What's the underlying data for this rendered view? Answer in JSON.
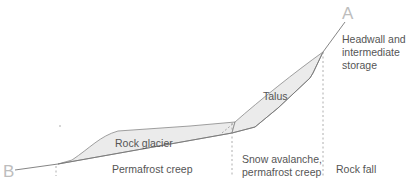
{
  "diagram": {
    "type": "cross-section profile",
    "endpoints": {
      "A": "A",
      "B": "B"
    },
    "deposits": {
      "rock_glacier": "Rock glacier",
      "talus": "Talus"
    },
    "zones": [
      {
        "id": "permafrost",
        "label": "Permafrost creep"
      },
      {
        "id": "snow",
        "label_line1": "Snow avalanche,",
        "label_line2": "permafrost creep"
      },
      {
        "id": "rockfall",
        "label": "Rock fall"
      }
    ],
    "headwall": {
      "line1": "Headwall and",
      "line2": "intermediate",
      "line3": "storage"
    },
    "colors": {
      "line": "#777777",
      "fill": "#ebebeb",
      "label_text": "#555555",
      "endpoint_text": "#bdbdbd"
    }
  }
}
